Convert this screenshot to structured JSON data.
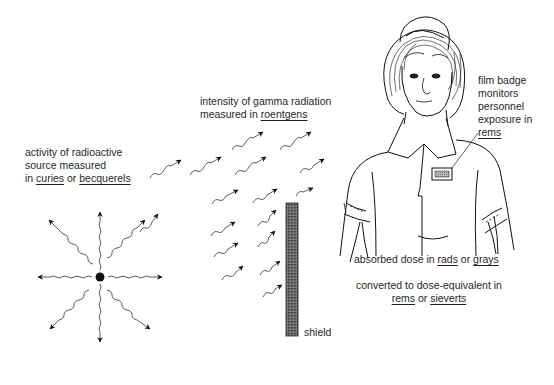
{
  "diagram": {
    "source": {
      "caption_lines": [
        "activity of radioactive",
        "source measured"
      ],
      "caption_prefix": "in ",
      "unit_1": "curies",
      "connector": " or ",
      "unit_2": "becquerels",
      "ray_count": 8
    },
    "gamma_field": {
      "caption_line_1": "intensity of gamma radiation",
      "caption_prefix": "measured in ",
      "unit": "roentgens"
    },
    "shield": {
      "label": "shield"
    },
    "badge": {
      "caption_lines": [
        "film badge",
        "monitors",
        "personnel",
        "exposure in"
      ],
      "unit": "rems"
    },
    "absorbed_dose": {
      "prefix": "absorbed dose in ",
      "unit_1": "rads",
      "connector": " or ",
      "unit_2": "grays"
    },
    "dose_equivalent": {
      "line_1": "converted to dose-equivalent in",
      "unit_1": "rems",
      "connector": " or ",
      "unit_2": "sieverts"
    }
  }
}
